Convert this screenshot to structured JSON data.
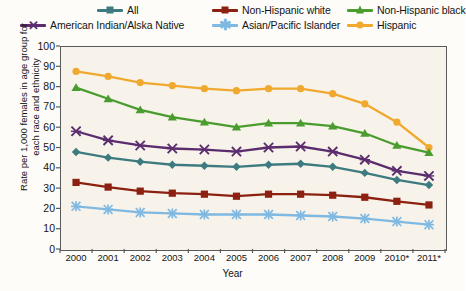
{
  "legend": {
    "items": [
      {
        "label": "All",
        "color": "#3e7b80",
        "marker": "diamond",
        "row": 0,
        "col": 0
      },
      {
        "label": "Non-Hispanic white",
        "color": "#8c2112",
        "marker": "square",
        "row": 0,
        "col": 1
      },
      {
        "label": "Non-Hispanic black",
        "color": "#4a9c2e",
        "marker": "triangle",
        "row": 0,
        "col": 2
      },
      {
        "label": "American Indian/Alska Native",
        "color": "#5b2d6e",
        "marker": "x",
        "row": 1,
        "col": 0
      },
      {
        "label": "Asian/Pacific Islander",
        "color": "#7fb9e2",
        "marker": "asterisk",
        "row": 1,
        "col": 1
      },
      {
        "label": "Hispanic",
        "color": "#f0a92e",
        "marker": "circle",
        "row": 1,
        "col": 2
      }
    ]
  },
  "axes": {
    "ylabel": "Rate per 1,000 females in age group for each race and ethnicity",
    "xlabel": "Year",
    "yticks": [
      "100",
      "90",
      "80",
      "70",
      "60",
      "50",
      "40",
      "30",
      "20",
      "10",
      "0"
    ],
    "xticks": [
      "2000",
      "2001",
      "2002",
      "2003",
      "2004",
      "2005",
      "2006",
      "2007",
      "2008",
      "2009",
      "2010*",
      "2011*"
    ]
  },
  "chart_data": {
    "type": "line",
    "title": "",
    "xlabel": "Year",
    "ylabel": "Rate per 1,000 females in age group for each race and ethnicity",
    "ylim": [
      0,
      100
    ],
    "ytick_step": 10,
    "grid": false,
    "legend_position": "top",
    "categories": [
      "2000",
      "2001",
      "2002",
      "2003",
      "2004",
      "2005",
      "2006",
      "2007",
      "2008",
      "2009",
      "2010*",
      "2011*"
    ],
    "series": [
      {
        "name": "Hispanic",
        "color": "#f0a92e",
        "marker": "circle",
        "values": [
          87.5,
          85.0,
          82.0,
          80.5,
          79.0,
          78.0,
          79.0,
          79.0,
          76.5,
          71.5,
          62.5,
          50.0
        ]
      },
      {
        "name": "Non-Hispanic black",
        "color": "#4a9c2e",
        "marker": "triangle",
        "values": [
          79.5,
          74.0,
          68.5,
          65.0,
          62.5,
          60.0,
          62.0,
          62.0,
          60.5,
          57.0,
          51.0,
          47.5
        ]
      },
      {
        "name": "American Indian/Alska Native",
        "color": "#5b2d6e",
        "marker": "x",
        "values": [
          58.0,
          53.5,
          51.0,
          49.5,
          49.0,
          48.0,
          50.0,
          50.5,
          48.0,
          44.0,
          38.5,
          36.0
        ]
      },
      {
        "name": "All",
        "color": "#3e7b80",
        "marker": "diamond",
        "values": [
          47.8,
          45.0,
          43.0,
          41.5,
          41.0,
          40.5,
          41.5,
          42.0,
          40.5,
          37.5,
          34.0,
          31.5
        ]
      },
      {
        "name": "Non-Hispanic white",
        "color": "#8c2112",
        "marker": "square",
        "values": [
          32.8,
          30.5,
          28.5,
          27.5,
          27.0,
          26.0,
          27.0,
          27.0,
          26.5,
          25.5,
          23.5,
          21.7
        ]
      },
      {
        "name": "Asian/Pacific Islander",
        "color": "#7fb9e2",
        "marker": "asterisk",
        "values": [
          21.0,
          19.5,
          18.0,
          17.5,
          17.0,
          17.0,
          17.0,
          16.5,
          16.0,
          15.0,
          13.5,
          12.0
        ]
      }
    ]
  }
}
